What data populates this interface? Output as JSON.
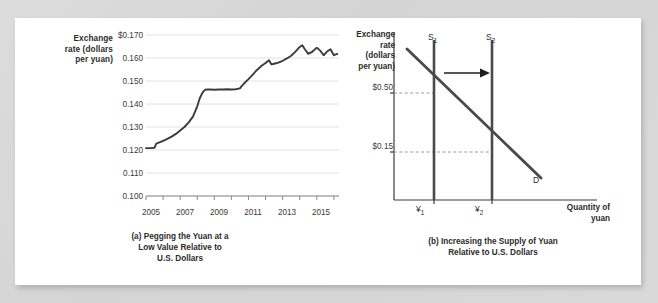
{
  "figure": {
    "background_color": "#d8d8d8",
    "card_color": "#ffffff"
  },
  "panel_a": {
    "y_axis_title": "Exchange\nrate (dollars\nper yuan)",
    "y_axis_title_lines": [
      "Exchange",
      "rate (dollars",
      "per yuan)"
    ],
    "caption_lines": [
      "(a) Pegging the Yuan at a",
      "Low Value Relative to",
      "U.S. Dollars"
    ],
    "caption": "(a) Pegging the Yuan at a Low Value Relative to U.S. Dollars"
  },
  "panel_b": {
    "y_axis_title_lines": [
      "Exchange",
      "rate",
      "(dollars",
      "per yuan)"
    ],
    "x_axis_title_lines": [
      "Quantity of",
      "yuan"
    ],
    "y_tick_high": "$0.50",
    "y_tick_low": "$0.15",
    "x_tick_1": "¥",
    "x_tick_1_sub": "1",
    "x_tick_2": "¥",
    "x_tick_2_sub": "2",
    "supply_1_label": "S",
    "supply_1_sub": "1",
    "supply_2_label": "S",
    "supply_2_sub": "2",
    "demand_label": "D",
    "caption_lines": [
      "(b) Increasing the Supply of Yuan",
      "Relative to U.S. Dollars"
    ],
    "caption": "(b) Increasing the Supply of Yuan Relative to U.S. Dollars",
    "shift_arrow": "rightward-arrow",
    "line_color": "#4a4a4a"
  },
  "chart_data": [
    {
      "type": "line",
      "panel": "a",
      "title": "(a) Pegging the Yuan at a Low Value Relative to U.S. Dollars",
      "xlabel": "",
      "ylabel": "Exchange rate (dollars per yuan)",
      "ylim": [
        0.1,
        0.17
      ],
      "xlim": [
        2005,
        2016.3
      ],
      "ytick_labels": [
        "0.100",
        "0.110",
        "0.120",
        "0.130",
        "0.140",
        "0.150",
        "0.160",
        "$0.170"
      ],
      "ytick_values": [
        0.1,
        0.11,
        0.12,
        0.13,
        0.14,
        0.15,
        0.16,
        0.17
      ],
      "xtick_labels": [
        "2005",
        "2007",
        "2009",
        "2011",
        "2013",
        "2015"
      ],
      "xtick_values": [
        2005,
        2007,
        2009,
        2011,
        2013,
        2015
      ],
      "minor_xticks": [
        2005,
        2006,
        2007,
        2008,
        2009,
        2010,
        2011,
        2012,
        2013,
        2014,
        2015,
        2016
      ],
      "grid": "horizontal",
      "legend": "none",
      "line_color": "#3b3b3b",
      "series": [
        {
          "name": "Exchange rate (dollars per yuan)",
          "x": [
            2005.0,
            2005.25,
            2005.5,
            2005.6,
            2005.75,
            2006.0,
            2006.25,
            2006.5,
            2006.75,
            2007.0,
            2007.25,
            2007.5,
            2007.75,
            2008.0,
            2008.15,
            2008.3,
            2008.45,
            2008.6,
            2008.75,
            2009.0,
            2009.25,
            2009.5,
            2009.75,
            2010.0,
            2010.25,
            2010.5,
            2010.6,
            2010.75,
            2011.0,
            2011.25,
            2011.5,
            2011.75,
            2012.0,
            2012.2,
            2012.35,
            2012.5,
            2012.75,
            2013.0,
            2013.25,
            2013.5,
            2013.75,
            2014.0,
            2014.15,
            2014.3,
            2014.5,
            2014.75,
            2015.0,
            2015.2,
            2015.4,
            2015.6,
            2015.8,
            2016.0,
            2016.2
          ],
          "y": [
            0.1208,
            0.1208,
            0.121,
            0.1228,
            0.1232,
            0.124,
            0.1248,
            0.1258,
            0.127,
            0.1285,
            0.13,
            0.132,
            0.1345,
            0.139,
            0.1425,
            0.1448,
            0.1462,
            0.1463,
            0.1463,
            0.1462,
            0.1463,
            0.1463,
            0.1464,
            0.1463,
            0.1464,
            0.1468,
            0.1478,
            0.149,
            0.1508,
            0.1528,
            0.1548,
            0.1565,
            0.1578,
            0.159,
            0.1572,
            0.1575,
            0.158,
            0.1588,
            0.1598,
            0.161,
            0.1628,
            0.1648,
            0.1655,
            0.1638,
            0.1618,
            0.1628,
            0.1645,
            0.1632,
            0.1612,
            0.1628,
            0.1638,
            0.1612,
            0.1618
          ]
        }
      ]
    },
    {
      "type": "line",
      "panel": "b",
      "title": "(b) Increasing the Supply of Yuan Relative to U.S. Dollars",
      "xlabel": "Quantity of yuan",
      "ylabel": "Exchange rate (dollars per yuan)",
      "grid": "none",
      "legend": "none",
      "annotations": [
        "S1",
        "S2",
        "D",
        "$0.50",
        "$0.15",
        "¥1",
        "¥2",
        "rightward shift arrow"
      ],
      "series": [
        {
          "name": "S1",
          "kind": "vertical-supply",
          "x": 1.0
        },
        {
          "name": "S2",
          "kind": "vertical-supply",
          "x": 2.0
        },
        {
          "name": "D",
          "kind": "demand",
          "points": [
            [
              0.25,
              0.74
            ],
            [
              2.6,
              0.05
            ]
          ]
        }
      ],
      "equilibria": [
        {
          "label": "E1",
          "x": 1.0,
          "y": "$0.50"
        },
        {
          "label": "E2",
          "x": 2.0,
          "y": "$0.15"
        }
      ]
    }
  ]
}
